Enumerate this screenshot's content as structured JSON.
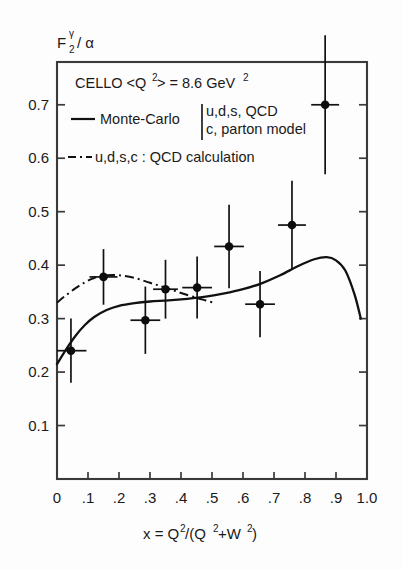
{
  "figure": {
    "caption_ylabel": "F",
    "ylabel_sub": "2",
    "ylabel_sup": "γ",
    "ylabel_tail": "/ α",
    "xlabel_plain": "x = Q2/(Q2+W2)",
    "background": "#fdfdfd",
    "ink_color": "#111111"
  },
  "annotations": {
    "experiment": "CELLO  <Q",
    "experiment_sup": "2",
    "experiment_mid": "> = 8.6 GeV",
    "experiment_sup2": "2",
    "experiment_full": "CELLO <Q2> = 8.6 GeV2"
  },
  "legend": {
    "position": "upper-left-inside",
    "items": [
      {
        "style": "solid",
        "label": "Monte-Carlo",
        "detail_line1": "u,d,s, QCD",
        "detail_line2": "c, parton model"
      },
      {
        "style": "dash-dot",
        "label": "u,d,s,c : QCD calculation",
        "detail_line1": "",
        "detail_line2": ""
      }
    ]
  },
  "chart_data": {
    "type": "scatter",
    "title": "",
    "subtitle": "",
    "xlabel": "x = Q2/(Q2+W2)",
    "ylabel": "F2γ / α",
    "xlim": [
      0,
      1.0
    ],
    "ylim": [
      0,
      0.78
    ],
    "grid": false,
    "legend_position": "upper left",
    "xticks": [
      0,
      0.1,
      0.2,
      0.3,
      0.4,
      0.5,
      0.6,
      0.7,
      0.8,
      0.9,
      1.0
    ],
    "xticklabels": [
      "0",
      ".1",
      ".2",
      ".3",
      ".4",
      ".5",
      ".6",
      ".7",
      ".8",
      ".9",
      "1.0"
    ],
    "yticks": [
      0.1,
      0.2,
      0.3,
      0.4,
      0.5,
      0.6,
      0.7
    ],
    "yticklabels": [
      "0.1",
      "0.2",
      "0.3",
      "0.4",
      "0.5",
      "0.6",
      "0.7"
    ],
    "series": [
      {
        "name": "CELLO data",
        "type": "errorbar-points",
        "marker": "filled-circle",
        "points": [
          {
            "x": 0.045,
            "y": 0.24,
            "xerr": 0.05,
            "yerr": 0.06
          },
          {
            "x": 0.15,
            "y": 0.378,
            "xerr": 0.045,
            "yerr": 0.052
          },
          {
            "x": 0.285,
            "y": 0.297,
            "xerr": 0.048,
            "yerr": 0.063
          },
          {
            "x": 0.35,
            "y": 0.355,
            "xerr": 0.04,
            "yerr": 0.055
          },
          {
            "x": 0.452,
            "y": 0.358,
            "xerr": 0.048,
            "yerr": 0.058
          },
          {
            "x": 0.555,
            "y": 0.435,
            "xerr": 0.048,
            "yerr": 0.078
          },
          {
            "x": 0.655,
            "y": 0.327,
            "xerr": 0.048,
            "yerr": 0.062
          },
          {
            "x": 0.758,
            "y": 0.475,
            "xerr": 0.045,
            "yerr": 0.083
          },
          {
            "x": 0.865,
            "y": 0.7,
            "xerr": 0.045,
            "yerr": 0.13
          }
        ]
      },
      {
        "name": "Monte-Carlo (u,d,s QCD + c parton model)",
        "type": "line",
        "style": "solid",
        "x": [
          0.0,
          0.03,
          0.06,
          0.09,
          0.12,
          0.16,
          0.2,
          0.25,
          0.3,
          0.36,
          0.42,
          0.48,
          0.54,
          0.6,
          0.66,
          0.72,
          0.78,
          0.83,
          0.87,
          0.9,
          0.93,
          0.96,
          0.98
        ],
        "y": [
          0.215,
          0.243,
          0.268,
          0.288,
          0.303,
          0.316,
          0.324,
          0.329,
          0.332,
          0.334,
          0.337,
          0.341,
          0.347,
          0.355,
          0.366,
          0.381,
          0.399,
          0.411,
          0.415,
          0.409,
          0.39,
          0.345,
          0.3
        ]
      },
      {
        "name": "u,d,s,c QCD calculation",
        "type": "line",
        "style": "dash-dot",
        "x": [
          0.0,
          0.03,
          0.06,
          0.09,
          0.12,
          0.16,
          0.2,
          0.25,
          0.3,
          0.35,
          0.4,
          0.45,
          0.48,
          0.51
        ],
        "y": [
          0.33,
          0.344,
          0.357,
          0.368,
          0.376,
          0.381,
          0.381,
          0.376,
          0.367,
          0.358,
          0.348,
          0.339,
          0.334,
          0.329
        ]
      }
    ]
  }
}
